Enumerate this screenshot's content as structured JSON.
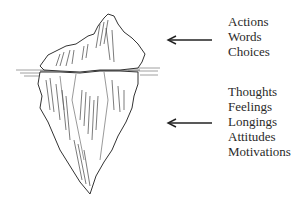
{
  "diagram": {
    "type": "iceberg-metaphor",
    "above_water": {
      "labels": [
        "Actions",
        "Words",
        "Choices"
      ]
    },
    "below_water": {
      "labels": [
        "Thoughts",
        "Feelings",
        "Longings",
        "Attitudes",
        "Motivations"
      ]
    },
    "icons": {
      "illustration": "iceberg-sketch-icon",
      "arrow": "arrow-left-icon"
    }
  }
}
